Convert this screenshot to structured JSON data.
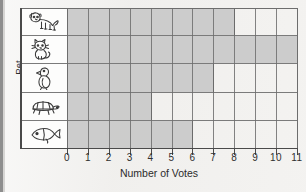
{
  "chart_data": {
    "type": "bar",
    "orientation": "horizontal",
    "title": "",
    "xlabel": "Number of Votes",
    "ylabel": "Pet",
    "categories": [
      "dog",
      "cat",
      "bird",
      "turtle",
      "fish"
    ],
    "values": [
      8,
      11,
      7,
      4,
      6
    ],
    "xlim": [
      0,
      11
    ],
    "xticks": [
      0,
      1,
      2,
      3,
      4,
      5,
      6,
      7,
      8,
      9,
      10,
      11
    ],
    "xtick_labels": [
      "0",
      "1",
      "2",
      "3",
      "4",
      "5",
      "6",
      "7",
      "8",
      "9",
      "10",
      "11"
    ],
    "grid": true,
    "legend": "none",
    "bar_color": "#c9c9c9",
    "axis_color": "#4a4a4a",
    "category_icons": [
      "dog-icon",
      "cat-icon",
      "bird-icon",
      "turtle-icon",
      "fish-icon"
    ]
  },
  "axis": {
    "x_title": "Number of Votes",
    "y_title": "Pet"
  }
}
